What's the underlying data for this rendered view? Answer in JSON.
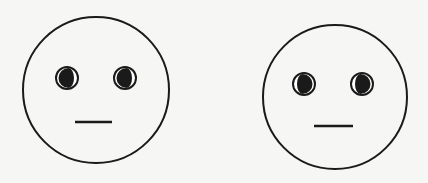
{
  "figure": {
    "background": "#f6f6f4",
    "ink": "#1a1a1a",
    "faces": [
      {
        "name": "left-face",
        "gaze": "left",
        "head": {
          "cx": 96,
          "cy": 90,
          "r": 73
        },
        "eyes": [
          {
            "cx": 67,
            "cy": 78,
            "r": 11
          },
          {
            "cx": 125,
            "cy": 78,
            "r": 11
          }
        ],
        "mouth": {
          "x1": 75,
          "x2": 112,
          "y": 122
        }
      },
      {
        "name": "right-face",
        "gaze": "right",
        "head": {
          "cx": 335,
          "cy": 97,
          "r": 72
        },
        "eyes": [
          {
            "cx": 304,
            "cy": 84,
            "r": 11
          },
          {
            "cx": 362,
            "cy": 84,
            "r": 11
          }
        ],
        "mouth": {
          "x1": 314,
          "x2": 353,
          "y": 126
        }
      }
    ]
  }
}
